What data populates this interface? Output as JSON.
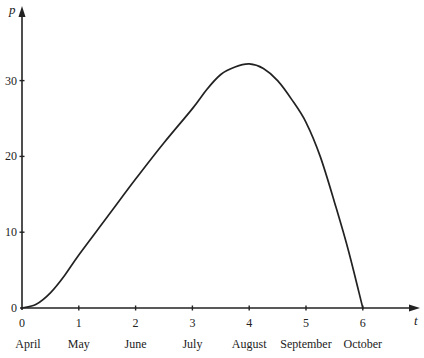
{
  "chart_data": {
    "type": "line",
    "title": "",
    "xlabel": "t",
    "ylabel": "p",
    "x_ticks": [
      0,
      1,
      2,
      3,
      4,
      5,
      6
    ],
    "x_tick_labels": [
      "0",
      "1",
      "2",
      "3",
      "4",
      "5",
      "6"
    ],
    "month_labels": [
      "April",
      "May",
      "June",
      "July",
      "August",
      "September",
      "October"
    ],
    "y_ticks": [
      0,
      10,
      20,
      30
    ],
    "y_tick_labels": [
      "0",
      "10",
      "20",
      "30"
    ],
    "xlim": [
      0,
      7
    ],
    "ylim": [
      0,
      37
    ],
    "grid": false,
    "legend": null,
    "series": [
      {
        "name": "p(t)",
        "x": [
          0,
          0.25,
          0.5,
          0.75,
          1,
          1.5,
          2,
          2.5,
          3,
          3.25,
          3.5,
          3.75,
          4,
          4.25,
          4.5,
          4.75,
          5,
          5.25,
          5.5,
          5.75,
          6
        ],
        "values": [
          0,
          0.5,
          2,
          4.3,
          7,
          12,
          17,
          21.8,
          26.3,
          28.8,
          30.8,
          31.8,
          32.2,
          31.6,
          30,
          27.5,
          24.5,
          20,
          14,
          7.5,
          0
        ]
      }
    ]
  }
}
